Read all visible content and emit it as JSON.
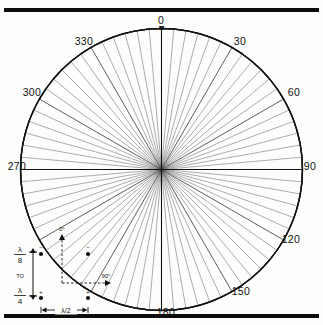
{
  "figure": {
    "type": "polar-radiation-pattern",
    "title": "",
    "top_rule_color": "#0d0d0d",
    "bottom_rule_color": "#0d0d0d",
    "background": "#fdfdfb",
    "trace_color": "#111111",
    "grid_color": "#555555"
  },
  "chart_data": {
    "type": "line",
    "subtype": "polar",
    "title": "",
    "xlabel": "",
    "ylabel": "",
    "grid": true,
    "legend_position": "bottom-left",
    "angle_unit": "degrees",
    "angle_labels": [
      "0",
      "30",
      "60",
      "90",
      "120",
      "150",
      "180",
      "210",
      "240",
      "270",
      "300",
      "330"
    ],
    "angle_labels_shown": [
      "0",
      "30",
      "60",
      "90",
      "120",
      "150",
      "180",
      "270",
      "300",
      "330"
    ],
    "angle_tick_step_deg": 5,
    "radial_axis": {
      "label": "dB below maximum",
      "tick_labels": [
        "2",
        "4",
        "6",
        "8",
        "10",
        "20",
        "30",
        "40",
        "50"
      ],
      "tick_values_db": [
        2,
        4,
        6,
        8,
        10,
        20,
        30,
        40,
        50
      ],
      "outer_value_db": 0,
      "center_value_db": 50,
      "scale": "logarithmic-dB"
    },
    "ring_values_db": [
      0,
      2,
      4,
      6,
      8,
      10,
      20,
      30,
      40,
      50
    ],
    "series": [
      {
        "name": "Pattern",
        "description": "Two-element broadside array, figure-eight pattern with nulls at 90 and 270 degrees",
        "theta_deg": [
          0,
          5,
          10,
          15,
          20,
          25,
          30,
          35,
          40,
          45,
          50,
          55,
          60,
          65,
          70,
          75,
          80,
          85,
          90,
          95,
          100,
          105,
          110,
          115,
          120,
          125,
          130,
          135,
          140,
          145,
          150,
          155,
          160,
          165,
          170,
          175,
          180,
          185,
          190,
          195,
          200,
          205,
          210,
          215,
          220,
          225,
          230,
          235,
          240,
          245,
          250,
          255,
          260,
          265,
          270,
          275,
          280,
          285,
          290,
          295,
          300,
          305,
          310,
          315,
          320,
          325,
          330,
          335,
          340,
          345,
          350,
          355
        ],
        "relative_db": [
          0.0,
          -0.03,
          -0.13,
          -0.3,
          -0.54,
          -0.84,
          -1.25,
          -1.74,
          -2.33,
          -3.01,
          -3.83,
          -4.8,
          -6.02,
          -7.46,
          -9.3,
          -11.7,
          -15.2,
          -21.2,
          -50.0,
          -21.2,
          -15.2,
          -11.7,
          -9.3,
          -7.46,
          -6.02,
          -4.8,
          -3.83,
          -3.01,
          -2.33,
          -1.74,
          -1.25,
          -0.84,
          -0.54,
          -0.3,
          -0.13,
          -0.03,
          0.0,
          -0.03,
          -0.13,
          -0.3,
          -0.54,
          -0.84,
          -1.25,
          -1.74,
          -2.33,
          -3.01,
          -3.83,
          -4.8,
          -6.02,
          -7.46,
          -9.3,
          -11.7,
          -15.2,
          -21.2,
          -50.0,
          -21.2,
          -15.2,
          -11.7,
          -9.3,
          -7.46,
          -6.02,
          -4.8,
          -3.83,
          -3.01,
          -2.33,
          -1.74,
          -1.25,
          -0.84,
          -0.54,
          -0.3,
          -0.13,
          -0.03
        ]
      }
    ]
  },
  "angle_labels": {
    "a0": "0",
    "a30": "30",
    "a60": "60",
    "a90": "90",
    "a120": "120",
    "a150": "150",
    "a180": "180",
    "a270": "270",
    "a300": "300",
    "a330": "330"
  },
  "db_labels": {
    "d2": "2",
    "d4": "4",
    "d6": "6",
    "d8": "8",
    "d10": "10",
    "d20": "20",
    "d30": "30",
    "d40": "40",
    "d50": "50"
  },
  "legend": {
    "height_top_num": "λ",
    "height_top_den": "8",
    "to_text": "TO",
    "height_bot_num": "λ",
    "height_bot_den": "4",
    "spacing_label": "λ/2",
    "dir_up_label": "0°",
    "dir_right_label": "90°",
    "phase_top_left": "−",
    "phase_top_right": "−",
    "phase_bottom_left": "+",
    "phase_bottom_right": "+"
  }
}
